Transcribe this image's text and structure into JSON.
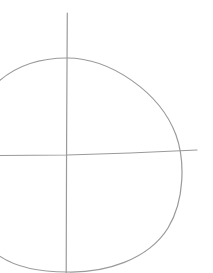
{
  "sketch": {
    "stroke_color": "#9a9a9a",
    "background": "#ffffff",
    "elements": [
      {
        "name": "vertical-axis-line",
        "type": "line"
      },
      {
        "name": "horizontal-axis-line",
        "type": "line"
      },
      {
        "name": "rounded-shape-outline",
        "type": "curve"
      }
    ]
  }
}
